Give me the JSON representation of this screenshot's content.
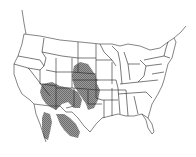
{
  "map": {
    "title": "",
    "subject": "Species range map of the contiguous United States and northern Mexico",
    "region_shown": "Contiguous United States",
    "range_color": "#8a8a8a",
    "outline_color": "#222222",
    "background_color": "#ffffff",
    "range_regions": [
      "Colorado (eastern)",
      "Kansas (western)",
      "Nebraska (southwestern)",
      "Oklahoma (western & panhandle)",
      "Texas (panhandle & west)",
      "New Mexico",
      "Arizona (eastern & southern)",
      "Utah (southeastern)",
      "Northern Mexico (Sonora, Chihuahua)"
    ]
  }
}
